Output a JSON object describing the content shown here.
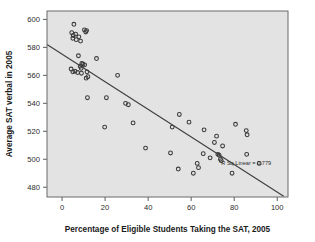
{
  "chart_data": {
    "type": "scatter",
    "title": "",
    "xlabel": "Percentage of Eligible Students Taking the SAT, 2005",
    "ylabel": "Average SAT verbal in 2005",
    "xlim": [
      -7,
      105
    ],
    "ylim": [
      473,
      606
    ],
    "xticks": [
      0,
      20,
      40,
      60,
      80,
      100
    ],
    "yticks": [
      480,
      500,
      520,
      540,
      560,
      580,
      600
    ],
    "grid": false,
    "legend": "none",
    "annotations": [
      {
        "name": "r-squared-label",
        "text": "R Sq Linear = 0.779",
        "x": 74,
        "y": 496
      }
    ],
    "fit_line": {
      "name": "linear-regression-line",
      "x_start": -7,
      "y_start": 582,
      "x_end": 103,
      "y_end": 473.5
    },
    "points": [
      {
        "x": 5.5,
        "y": 596.5
      },
      {
        "x": 4.5,
        "y": 590.5
      },
      {
        "x": 5.2,
        "y": 588.5
      },
      {
        "x": 5.0,
        "y": 586.5
      },
      {
        "x": 6.3,
        "y": 589.5
      },
      {
        "x": 6.6,
        "y": 585.5
      },
      {
        "x": 7.8,
        "y": 587.5
      },
      {
        "x": 8.6,
        "y": 584.5
      },
      {
        "x": 10.4,
        "y": 592.5
      },
      {
        "x": 11.4,
        "y": 592.0
      },
      {
        "x": 11.0,
        "y": 591.0
      },
      {
        "x": 7.6,
        "y": 574.0
      },
      {
        "x": 9.2,
        "y": 568.5
      },
      {
        "x": 9.7,
        "y": 568.0
      },
      {
        "x": 10.5,
        "y": 567.5
      },
      {
        "x": 8.4,
        "y": 566.5
      },
      {
        "x": 8.9,
        "y": 565.0
      },
      {
        "x": 4.2,
        "y": 564.5
      },
      {
        "x": 5.0,
        "y": 562.5
      },
      {
        "x": 6.0,
        "y": 563.0
      },
      {
        "x": 7.2,
        "y": 562.0
      },
      {
        "x": 9.0,
        "y": 561.5
      },
      {
        "x": 11.6,
        "y": 562.5
      },
      {
        "x": 12.0,
        "y": 559.0
      },
      {
        "x": 11.2,
        "y": 558.0
      },
      {
        "x": 16.0,
        "y": 572.0
      },
      {
        "x": 25.8,
        "y": 560.0
      },
      {
        "x": 11.8,
        "y": 544.0
      },
      {
        "x": 20.6,
        "y": 544.0
      },
      {
        "x": 29.5,
        "y": 540.0
      },
      {
        "x": 30.8,
        "y": 539.0
      },
      {
        "x": 19.8,
        "y": 523.0
      },
      {
        "x": 33.0,
        "y": 526.0
      },
      {
        "x": 38.8,
        "y": 508.0
      },
      {
        "x": 50.4,
        "y": 504.5
      },
      {
        "x": 51.2,
        "y": 523.0
      },
      {
        "x": 54.5,
        "y": 532.0
      },
      {
        "x": 54.0,
        "y": 493.0
      },
      {
        "x": 59.0,
        "y": 526.5
      },
      {
        "x": 61.0,
        "y": 490.0
      },
      {
        "x": 62.8,
        "y": 497.0
      },
      {
        "x": 63.4,
        "y": 494.0
      },
      {
        "x": 65.6,
        "y": 504.0
      },
      {
        "x": 66.0,
        "y": 521.0
      },
      {
        "x": 68.8,
        "y": 501.0
      },
      {
        "x": 70.8,
        "y": 512.0
      },
      {
        "x": 71.8,
        "y": 516.5
      },
      {
        "x": 72.4,
        "y": 503.5
      },
      {
        "x": 73.0,
        "y": 503.0
      },
      {
        "x": 73.6,
        "y": 500.0
      },
      {
        "x": 74.0,
        "y": 499.0
      },
      {
        "x": 74.6,
        "y": 509.5
      },
      {
        "x": 79.0,
        "y": 490.0
      },
      {
        "x": 80.6,
        "y": 525.0
      },
      {
        "x": 85.6,
        "y": 520.5
      },
      {
        "x": 86.0,
        "y": 517.5
      },
      {
        "x": 85.8,
        "y": 503.5
      },
      {
        "x": 91.6,
        "y": 497.0
      }
    ]
  }
}
